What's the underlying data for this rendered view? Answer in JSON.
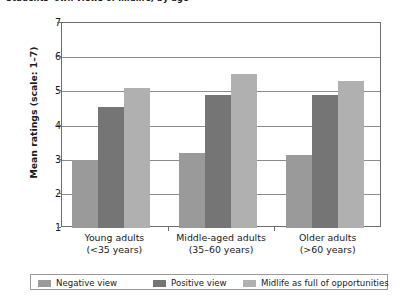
{
  "chart_data": {
    "type": "bar",
    "title": "Students' own views of midlife, by age",
    "xlabel": "",
    "ylabel": "Mean ratings (scale: 1–7)",
    "ylim": [
      1,
      7
    ],
    "yticks": [
      1,
      2,
      3,
      4,
      5,
      6,
      7
    ],
    "grid": true,
    "legend_position": "bottom",
    "categories": [
      {
        "line1": "Young adults",
        "line2": "(<35 years)"
      },
      {
        "line1": "Middle-aged adults",
        "line2": "(35–60 years)"
      },
      {
        "line1": "Older adults",
        "line2": "(>60 years)"
      }
    ],
    "category_labels": [
      "Young adults (<35 years)",
      "Middle-aged adults (35–60 years)",
      "Older adults (>60 years)"
    ],
    "series": [
      {
        "name": "Negative view",
        "color": "#9a9a9a",
        "values": [
          3.0,
          3.2,
          3.15
        ]
      },
      {
        "name": "Positive view",
        "color": "#757575",
        "values": [
          4.55,
          4.9,
          4.9
        ]
      },
      {
        "name": "Midlife as full of opportunities",
        "color": "#b0b0b0",
        "values": [
          5.1,
          5.5,
          5.3
        ]
      }
    ]
  },
  "axis": {
    "y_title": "Mean ratings (scale: 1–7)",
    "tick_labels": [
      "7",
      "6",
      "5",
      "4",
      "3",
      "2",
      "1"
    ]
  },
  "legend": {
    "items": [
      {
        "label": "Negative view",
        "color": "#9a9a9a"
      },
      {
        "label": "Positive view",
        "color": "#757575"
      },
      {
        "label": "Midlife as full of opportunities",
        "color": "#b0b0b0"
      }
    ]
  }
}
